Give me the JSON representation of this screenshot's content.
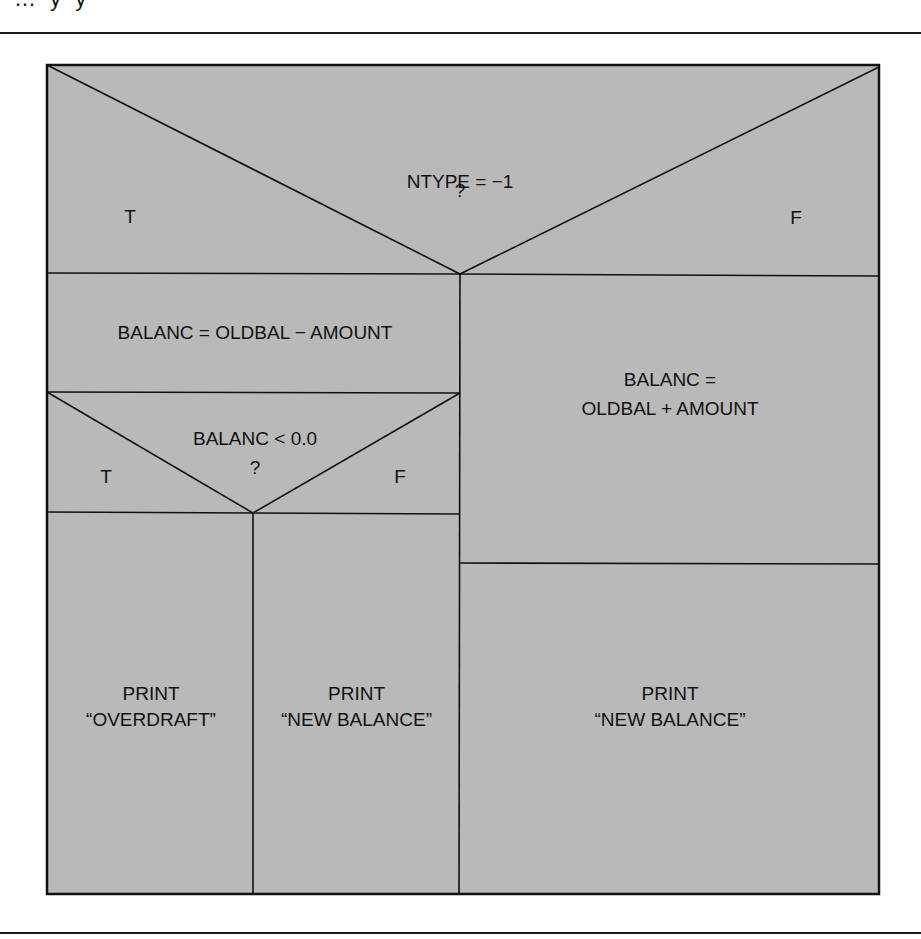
{
  "figure": {
    "page_fragment": "… y y",
    "fill_color": "#b9b9b9",
    "line_color": "#111111"
  },
  "diagram": {
    "type": "nassi-shneiderman",
    "decision_1": {
      "condition": "NTYPE = −1",
      "question": "?",
      "true_label": "T",
      "false_label": "F"
    },
    "true_branch": {
      "process": "BALANC = OLDBAL − AMOUNT",
      "decision_2": {
        "condition": "BALANC < 0.0",
        "question": "?",
        "true_label": "T",
        "false_label": "F"
      },
      "true_action": {
        "line1": "PRINT",
        "line2": "“OVERDRAFT”"
      },
      "false_action": {
        "line1": "PRINT",
        "line2": "“NEW BALANCE”"
      }
    },
    "false_branch": {
      "process_line1": "BALANC =",
      "process_line2": "OLDBAL + AMOUNT",
      "action": {
        "line1": "PRINT",
        "line2": "“NEW BALANCE”"
      }
    }
  }
}
